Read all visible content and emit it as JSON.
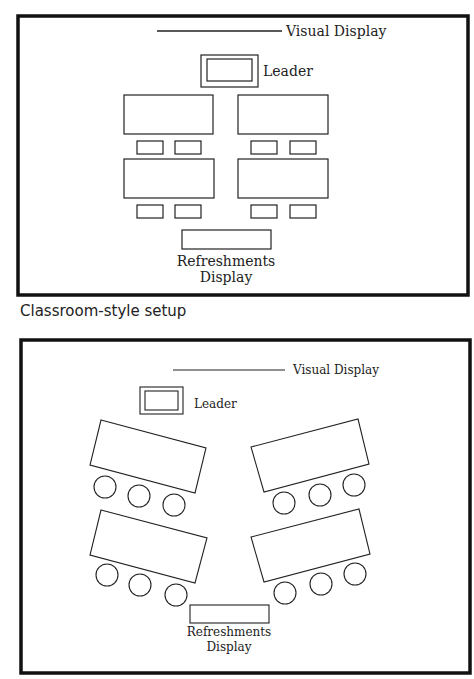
{
  "diagrams": [
    {
      "id": "classroom",
      "caption": "Classroom-style setup",
      "labels": {
        "visual_display": "Visual Display",
        "leader": "Leader",
        "refreshments_line1": "Refreshments",
        "refreshments_line2": "Display"
      },
      "tables": 4,
      "chairs": 8,
      "chair_shape": "rectangle"
    },
    {
      "id": "angled",
      "caption": "",
      "labels": {
        "visual_display": "Visual Display",
        "leader": "Leader",
        "refreshments_line1": "Refreshments",
        "refreshments_line2": "Display"
      },
      "tables": 4,
      "chairs": 12,
      "chair_shape": "circle"
    }
  ],
  "colors": {
    "stroke": "#222222",
    "frame": "#111111",
    "background": "#ffffff"
  }
}
